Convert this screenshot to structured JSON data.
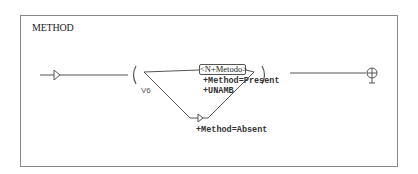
{
  "diagram": {
    "title": "METHOD",
    "variable_label": "V6",
    "node_label": "<N+Metodo>",
    "node_outputs": [
      "+Method=Present",
      "+UNAMB"
    ],
    "bypass_output": "+Method=Absent",
    "stroke_color": "#555555",
    "frame_color": "#8a8a8a",
    "start_icon": "arrow-triangle-icon",
    "end_icon": "circle-cross-terminal-icon"
  }
}
